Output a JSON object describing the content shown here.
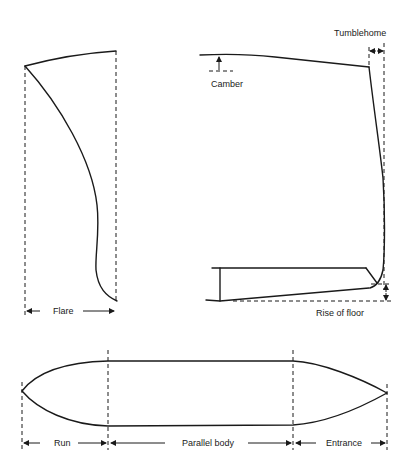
{
  "diagram": {
    "sections": {
      "body_section": {
        "labels": {
          "flare": "Flare"
        }
      },
      "midship_section": {
        "labels": {
          "tumblehome": "Tumblehome",
          "camber": "Camber",
          "rise_of_floor": "Rise of floor"
        }
      },
      "plan_view": {
        "labels": {
          "run": "Run",
          "parallel_body": "Parallel body",
          "entrance": "Entrance"
        }
      }
    },
    "colors": {
      "line": "#1a1a1a",
      "background": "#ffffff"
    }
  }
}
